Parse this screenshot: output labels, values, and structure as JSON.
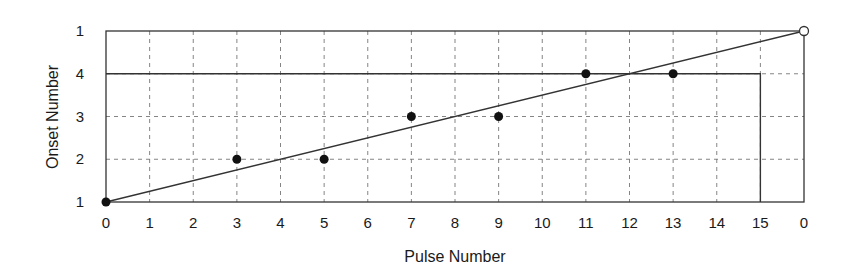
{
  "chart_data": {
    "type": "scatter",
    "title": "",
    "xlabel": "Pulse Number",
    "ylabel": "Onset Number",
    "x_tick_labels": [
      "0",
      "1",
      "2",
      "3",
      "4",
      "5",
      "6",
      "7",
      "8",
      "9",
      "10",
      "11",
      "12",
      "13",
      "14",
      "15",
      "0"
    ],
    "y_tick_labels": [
      "1",
      "2",
      "3",
      "4",
      "1"
    ],
    "xlim": [
      0,
      16
    ],
    "ylim": [
      0,
      4
    ],
    "grid": true,
    "series": [
      {
        "name": "onsets",
        "marker": "filled-circle",
        "points": [
          {
            "x": 0,
            "y": 1
          },
          {
            "x": 3,
            "y": 2
          },
          {
            "x": 5,
            "y": 2
          },
          {
            "x": 7,
            "y": 3
          },
          {
            "x": 9,
            "y": 3
          },
          {
            "x": 11,
            "y": 4
          },
          {
            "x": 13,
            "y": 4
          }
        ]
      },
      {
        "name": "cycle-end",
        "marker": "open-circle",
        "points": [
          {
            "x": 16,
            "y": 5
          }
        ]
      }
    ],
    "lines": [
      {
        "name": "diagonal-line",
        "from": {
          "x": 0,
          "y": 1
        },
        "to": {
          "x": 16,
          "y": 5
        }
      },
      {
        "name": "step-boundary",
        "path": [
          {
            "x": 0,
            "y": 4
          },
          {
            "x": 15,
            "y": 4
          },
          {
            "x": 15,
            "y": 1
          }
        ]
      }
    ]
  },
  "axes": {
    "xlabel": "Pulse Number",
    "ylabel": "Onset Number"
  }
}
